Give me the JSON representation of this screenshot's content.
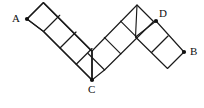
{
  "figure": {
    "background_color": "#ffffff",
    "stroke_color": "#1a1a1a",
    "label_color": "#101010",
    "canvas": {
      "width": 204,
      "height": 108
    },
    "geometry": {
      "square_half_diagonal": 18,
      "squares_A_to_C": 4,
      "squares_C_to_apex": 3,
      "squares_apex_to_B": 2,
      "note": "Squares are drawn rotated 45 degrees and joined corner to corner forming a zigzag band."
    },
    "vertices": [
      {
        "id": "A",
        "label": "A",
        "x": 27,
        "y": 19,
        "label_x": 12,
        "label_y": 13,
        "dot": true
      },
      {
        "id": "C",
        "label": "C",
        "x": 92,
        "y": 80,
        "label_x": 88,
        "label_y": 84,
        "dot": true
      },
      {
        "id": "D",
        "label": "D",
        "x": 156,
        "y": 21,
        "label_x": 159,
        "label_y": 8,
        "dot": true
      },
      {
        "id": "B",
        "label": "B",
        "x": 184,
        "y": 52,
        "label_x": 190,
        "label_y": 46,
        "dot": true
      }
    ],
    "outline_upper": "27,19 45,3 63,21 81,3 99,21 117,3 135,21 137,3 156,21 174,3 192,21 184,52",
    "outline_lower": "27,19 45,37 63,19 81,37 99,19 117,37 135,19 153,37 171,19 189,37 184,52",
    "paths": {
      "left_arm_upper": "27,19 45,3 63,21 81,3 99,21 117,3 135,21 92,80",
      "main_zigzag_top": "27,19 45,3 63,21 81,3 99,21 117,3 135,21 137,21",
      "main_zigzag_bottom": "27,19 10,37"
    },
    "chains": {
      "left": {
        "start": {
          "x": 27,
          "y": 19
        },
        "end": {
          "x": 92,
          "y": 80
        },
        "direction": "down-right",
        "count": 4
      },
      "middle": {
        "start": {
          "x": 92,
          "y": 80
        },
        "end": {
          "x": 146,
          "y": 12
        },
        "direction": "up-right",
        "count": 3
      },
      "right": {
        "start": {
          "x": 156,
          "y": 21
        },
        "end": {
          "x": 184,
          "y": 52
        },
        "direction": "down-right",
        "count": 2
      }
    }
  }
}
